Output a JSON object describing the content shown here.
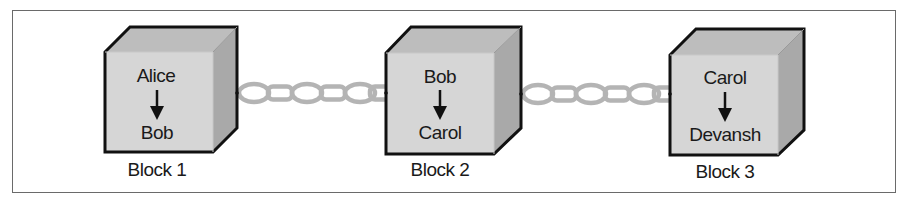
{
  "diagram": {
    "type": "blockchain-chain",
    "colors": {
      "border": "#6a6a6a",
      "cube_front": "#d6d6d6",
      "cube_top": "#bdbdbd",
      "cube_side": "#a9a9a9",
      "cube_outline": "#111111",
      "chain": "#b4b4b4",
      "text": "#1a1a1a"
    },
    "blocks": [
      {
        "label": "Block 1",
        "from": "Alice",
        "to": "Bob"
      },
      {
        "label": "Block 2",
        "from": "Bob",
        "to": "Carol"
      },
      {
        "label": "Block 3",
        "from": "Carol",
        "to": "Devansh"
      }
    ],
    "links": [
      {
        "from": "Block 1",
        "to": "Block 2",
        "icon": "chain-icon"
      },
      {
        "from": "Block 2",
        "to": "Block 3",
        "icon": "chain-icon"
      }
    ]
  }
}
